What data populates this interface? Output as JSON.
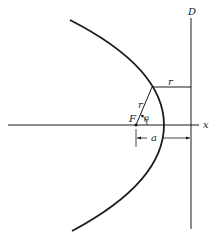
{
  "diagram": {
    "type": "parabola-focus-directrix",
    "labels": {
      "directrix": "D",
      "x_axis": "x",
      "focus": "F",
      "radius_focal": "r",
      "radius_directrix": "r",
      "angle": "θ",
      "distance": "a"
    },
    "colors": {
      "stroke": "#1a1a1a",
      "background": "#ffffff"
    }
  }
}
